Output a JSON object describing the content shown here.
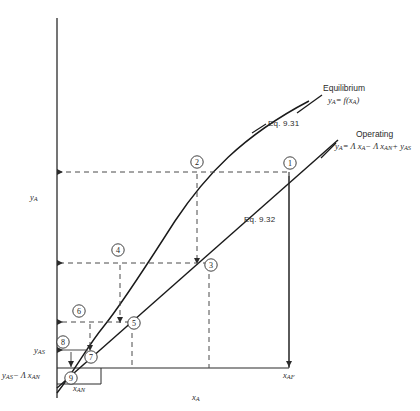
{
  "figure": {
    "kind": "stage-construction-diagram",
    "background": "#ffffff",
    "ink": "#1a1a1a",
    "dash_color": "#4a4a4a"
  },
  "axes": {
    "y_label": "y",
    "y_label_sub": "A",
    "x_label": "x",
    "x_label_sub": "A",
    "x_axis_px": {
      "x0": 57,
      "y0": 393,
      "x1": 57,
      "y1": 18
    },
    "x_bottom_px": {
      "x0": 57,
      "y0": 393,
      "x1": 330,
      "y1": 393
    }
  },
  "curves": {
    "equilibrium": {
      "name": "Equilibrium",
      "eq_label": "Eq. 9.31",
      "formula_lead": "y",
      "formula_sub": "A",
      "formula_rest": "= f(x",
      "formula_sub2": "A",
      "formula_tail": ")"
    },
    "operating": {
      "name": "Operating",
      "eq_label": "Eq. 9.32",
      "formula": "y_A = Λ x_A − Λ x_AN + y_AS",
      "parts": {
        "p1": "y",
        "s1": "A",
        "p2": "= Λ x",
        "s2": "A",
        "p3": "− Λ x",
        "s3": "AN",
        "p4": "+ y",
        "s4": "AS"
      }
    }
  },
  "ticks": {
    "y_as": {
      "text": "y",
      "sub": "AS"
    },
    "y_as_minus": {
      "p1": "y",
      "s1": "AS",
      "p2": "− Λ x",
      "s2": "AN"
    },
    "x_an": {
      "text": "x",
      "sub": "AN"
    },
    "x_af": {
      "text": "x",
      "sub": "AF"
    }
  },
  "stages": [
    {
      "id": "1",
      "label": "1",
      "cx": 290,
      "cy": 163
    },
    {
      "id": "2",
      "label": "2",
      "cx": 197,
      "cy": 163
    },
    {
      "id": "3",
      "label": "3",
      "cx": 210,
      "cy": 263
    },
    {
      "id": "4",
      "label": "4",
      "cx": 118,
      "cy": 250
    },
    {
      "id": "5",
      "label": "5",
      "cx": 133,
      "cy": 322
    },
    {
      "id": "6",
      "label": "6",
      "cx": 78,
      "cy": 311
    },
    {
      "id": "7",
      "label": "7",
      "cx": 89,
      "cy": 355
    },
    {
      "id": "8",
      "label": "8",
      "cx": 62,
      "cy": 342
    },
    {
      "id": "9",
      "label": "9",
      "cx": 70,
      "cy": 377
    }
  ]
}
